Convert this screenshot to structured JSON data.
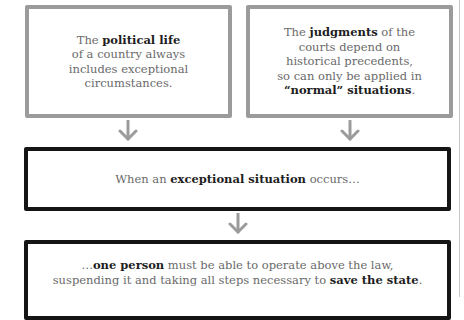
{
  "diagram": {
    "type": "flowchart",
    "colors": {
      "premise_border": "#9b9b9b",
      "conclusion_border": "#151515",
      "arrow": "#9b9b9b",
      "text_regular": "#6a6a6a",
      "text_bold": "#1e1e1e"
    },
    "boxes": [
      {
        "id": "box-1",
        "style": "gray",
        "lines": [
          {
            "pre": "The ",
            "bold": "political life",
            "post": ""
          },
          {
            "pre": "of a country always",
            "bold": "",
            "post": ""
          },
          {
            "pre": "includes exceptional",
            "bold": "",
            "post": ""
          },
          {
            "pre": "circumstances.",
            "bold": "",
            "post": ""
          }
        ]
      },
      {
        "id": "box-2",
        "style": "gray",
        "lines": [
          {
            "pre": "The ",
            "bold": "judgments",
            "post": " of the"
          },
          {
            "pre": "courts depend on",
            "bold": "",
            "post": ""
          },
          {
            "pre": "historical precedents,",
            "bold": "",
            "post": ""
          },
          {
            "pre": "so can only be applied in",
            "bold": "",
            "post": ""
          },
          {
            "pre": "",
            "bold": "“normal” situations",
            "post": "."
          }
        ]
      },
      {
        "id": "box-3",
        "style": "black",
        "lines": [
          {
            "pre": "When an ",
            "bold": "exceptional situation",
            "post": " occurs…"
          }
        ]
      },
      {
        "id": "box-4",
        "style": "black",
        "lines": [
          {
            "pre": "…",
            "bold": "one person",
            "post": " must be able to operate above the law,"
          },
          {
            "pre": "suspending it and taking all steps necessary to ",
            "bold": "save the state",
            "post": "."
          }
        ]
      }
    ],
    "arrows": [
      {
        "id": "arrow-1",
        "from": "box-1",
        "to": "box-3",
        "icon": "arrow-down-icon"
      },
      {
        "id": "arrow-2",
        "from": "box-2",
        "to": "box-3",
        "icon": "arrow-down-icon"
      },
      {
        "id": "arrow-3",
        "from": "box-3",
        "to": "box-4",
        "icon": "arrow-down-icon"
      }
    ]
  }
}
